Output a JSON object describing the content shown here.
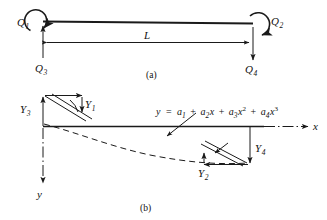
{
  "figure": {
    "panels": [
      {
        "caption": "(a)",
        "description": "Beam element with end moments and end forces",
        "labels": {
          "moment_left": "Q",
          "moment_left_sub": "1",
          "moment_right": "Q",
          "moment_right_sub": "2",
          "force_left": "Q",
          "force_left_sub": "3",
          "force_right": "Q",
          "force_right_sub": "4",
          "length": "L"
        }
      },
      {
        "caption": "(b)",
        "description": "Beam element nodal displacements and rotations with assumed cubic deflection curve",
        "labels": {
          "disp_left": "Y",
          "disp_left_sub": "3",
          "rot_left": "Y",
          "rot_left_sub": "1",
          "rot_right": "Y",
          "rot_right_sub": "2",
          "disp_right": "Y",
          "disp_right_sub": "4",
          "axis_x": "x",
          "axis_y": "y"
        },
        "equation": {
          "lhs": "y",
          "equals": "=",
          "terms": [
            {
              "coef": "a",
              "coef_sub": "1",
              "var": "",
              "power": ""
            },
            {
              "coef": "a",
              "coef_sub": "2",
              "var": "x",
              "power": ""
            },
            {
              "coef": "a",
              "coef_sub": "3",
              "var": "x",
              "power": "2"
            },
            {
              "coef": "a",
              "coef_sub": "4",
              "var": "x",
              "power": "3"
            }
          ],
          "plain_text": "y = a1 + a2x + a3x^2 + a4x^3"
        }
      }
    ],
    "colors": {
      "ink": "#1a1a1a",
      "background": "#ffffff"
    }
  }
}
